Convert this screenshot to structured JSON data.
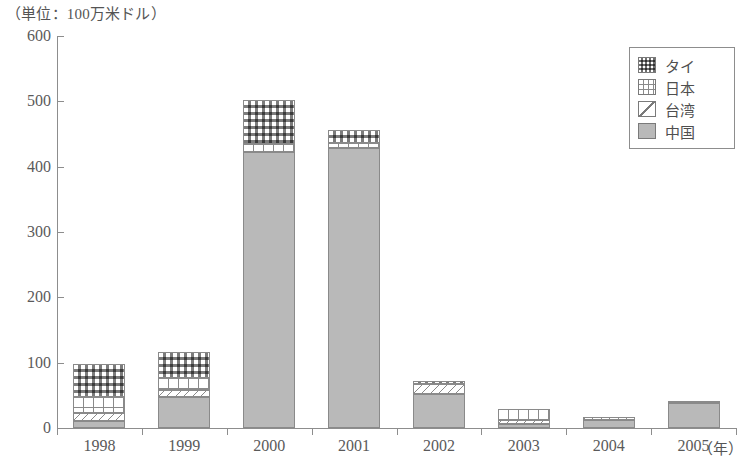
{
  "unit_caption": "（単位：100万米ドル）",
  "x_axis_unit": "（年）",
  "legend": {
    "items": [
      {
        "label": "タイ",
        "pattern": "dotted-grid",
        "key": "thailand"
      },
      {
        "label": "日本",
        "pattern": "grid",
        "key": "japan"
      },
      {
        "label": "台湾",
        "pattern": "diagonal",
        "key": "taiwan"
      },
      {
        "label": "中国",
        "pattern": "solid-gray",
        "key": "china"
      }
    ]
  },
  "colors": {
    "axis": "#8d8d8d",
    "text": "#4f4f4f",
    "china_fill": "#b9b9b9",
    "hatch": "#8a8a8a",
    "background": "#ffffff"
  },
  "chart_data": {
    "type": "bar",
    "stacked": true,
    "title": "（単位：100万米ドル）",
    "xlabel": "（年）",
    "ylabel": "",
    "categories": [
      "1998",
      "1999",
      "2000",
      "2001",
      "2002",
      "2003",
      "2004",
      "2005"
    ],
    "ylim": [
      0,
      600
    ],
    "yticks": [
      0,
      100,
      200,
      300,
      400,
      500,
      600
    ],
    "ytick_labels": [
      "0",
      "100",
      "200",
      "300",
      "400",
      "500",
      "600"
    ],
    "grid": false,
    "legend_position": "top-right",
    "series": [
      {
        "name": "中国",
        "key": "china",
        "values": [
          10,
          47,
          423,
          428,
          52,
          6,
          13,
          38
        ]
      },
      {
        "name": "台湾",
        "key": "taiwan",
        "values": [
          13,
          11,
          0,
          0,
          16,
          6,
          4,
          3
        ]
      },
      {
        "name": "日本",
        "key": "japan",
        "values": [
          24,
          19,
          11,
          8,
          0,
          17,
          0,
          0
        ]
      },
      {
        "name": "タイ",
        "key": "thailand",
        "values": [
          51,
          39,
          68,
          20,
          4,
          0,
          0,
          0
        ]
      }
    ],
    "totals": [
      98,
      116,
      502,
      456,
      72,
      29,
      17,
      41
    ],
    "footnote": ""
  },
  "footnote": ""
}
